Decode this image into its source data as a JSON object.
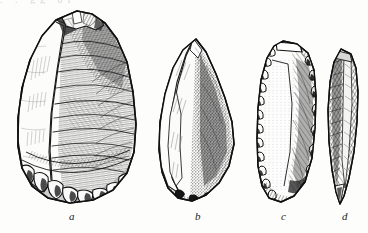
{
  "figure": {
    "kind": "engraving-plate",
    "background_color": "#fdfdfc",
    "ink_color": "#1b1b1b",
    "width": 368,
    "height": 233,
    "top_cut_text": ". . gg of"
  },
  "specimens": [
    {
      "id": "a",
      "caption": "a",
      "name": "handaxe",
      "shape": "pear-shaped / teardrop biface",
      "position": {
        "x": 14,
        "y": 10,
        "width": 126,
        "height": 195
      },
      "features": [
        "pointed chipped apex",
        "pale cortex band on left edge",
        "curved flake-ripple hatching on right face",
        "scalloped nodular cortex butt at base"
      ]
    },
    {
      "id": "b",
      "caption": "b",
      "name": "point",
      "shape": "elongated pointed flake",
      "position": {
        "x": 157,
        "y": 38,
        "width": 78,
        "height": 170
      },
      "features": [
        "sharp upper point",
        "pale flaked facet on left",
        "dark stippled right face",
        "irregular chipped base"
      ]
    },
    {
      "id": "c",
      "caption": "c",
      "name": "side-scraper blade",
      "shape": "long rounded-end blade",
      "position": {
        "x": 256,
        "y": 40,
        "width": 60,
        "height": 168
      },
      "features": [
        "heavily retouched serrated margins",
        "pale interior with vertical stipple",
        "dark hatched right side",
        "flat struck platform at top"
      ]
    },
    {
      "id": "d",
      "caption": "d",
      "name": "narrow blade",
      "shape": "slender elongated blade",
      "position": {
        "x": 327,
        "y": 48,
        "width": 32,
        "height": 158
      },
      "features": [
        "dark close hatching",
        "central ridge",
        "tapering pointed tip at base"
      ]
    }
  ],
  "captions": {
    "a": "a",
    "b": "b",
    "c": "c",
    "d": "d"
  }
}
